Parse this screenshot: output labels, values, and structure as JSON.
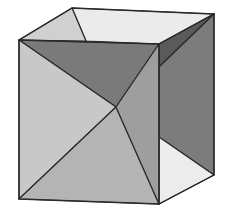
{
  "figure": {
    "colors": {
      "background": "#ffffff",
      "edge": "#2a2a2a",
      "top_left_triangle": "#d0d0d0",
      "top_back_face": "#ebebeb",
      "front_upper_triangle": "#7a7a7a",
      "front_left_triangle": "#c8c8c8",
      "front_bottom_triangle": "#b4b4b4",
      "front_right_triangle": "#9e9e9e",
      "right_dark_sliver": "#5a5a5a",
      "right_face_panel": "#7c7c7c",
      "right_bottom_light": "#ececec"
    },
    "vertices": {
      "front_top_left": [
        19,
        40
      ],
      "front_top_right": [
        159,
        44
      ],
      "front_bottom_left": [
        19,
        199
      ],
      "front_bottom_right": [
        159,
        204
      ],
      "back_top_left": [
        72,
        8
      ],
      "back_top_right": [
        214,
        14
      ],
      "back_bottom_right": [
        214,
        175
      ],
      "front_center": [
        116,
        107
      ],
      "top_edge_point": [
        86,
        41
      ],
      "right_edge_upper_point": [
        159,
        67
      ],
      "right_edge_lower_point": [
        159,
        137
      ]
    }
  }
}
